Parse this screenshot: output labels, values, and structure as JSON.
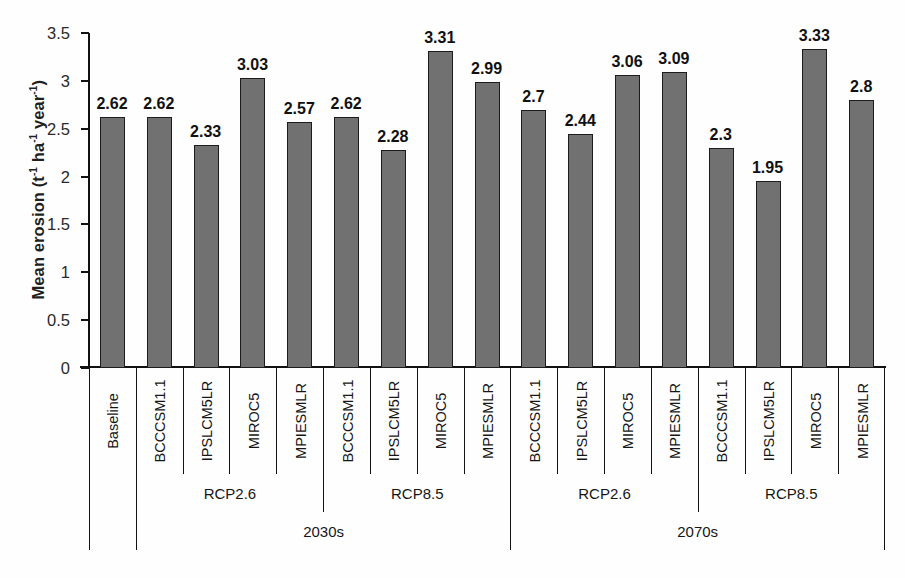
{
  "chart_data": {
    "type": "bar",
    "title": "",
    "xlabel": "",
    "ylabel": "Mean erosion (t-1 ha-1 year-1)",
    "ylabel_parts": {
      "prefix": "Mean erosion (t",
      "sup1": "-1",
      "mid1": " ha",
      "sup2": "-1",
      "mid2": " year",
      "sup3": "-1",
      "suffix": ")"
    },
    "ylim": [
      0,
      3.5
    ],
    "ytick_values": [
      3.5,
      3,
      2.5,
      2,
      1.5,
      1,
      0.5,
      0
    ],
    "ytick_labels": [
      "3.5",
      "3",
      "2.5",
      "2",
      "1.5",
      "1",
      "0.5",
      "0"
    ],
    "grid": false,
    "legend": "none",
    "categories": [
      "Baseline",
      "BCCCSM1.1",
      "IPSLCM5LR",
      "MIROC5",
      "MPIESMLR",
      "BCCCSM1.1",
      "IPSLCM5LR",
      "MIROC5",
      "MPIESMLR",
      "BCCCSM1.1",
      "IPSLCM5LR",
      "MIROC5",
      "MPIESMLR",
      "BCCCSM1.1",
      "IPSLCM5LR",
      "MIROC5",
      "MPIESMLR"
    ],
    "values": [
      2.62,
      2.62,
      2.33,
      3.03,
      2.57,
      2.62,
      2.28,
      3.31,
      2.99,
      2.7,
      2.44,
      3.06,
      3.09,
      2.3,
      1.95,
      3.33,
      2.8
    ],
    "value_labels": [
      "2.62",
      "2.62",
      "2.33",
      "3.03",
      "2.57",
      "2.62",
      "2.28",
      "3.31",
      "2.99",
      "2.7",
      "2.44",
      "3.06",
      "3.09",
      "2.3",
      "1.95",
      "3.33",
      "2.8"
    ],
    "bar_color": "#717171",
    "bar_edge_color": "#1c1c1c",
    "group_level_1": [
      {
        "label": "",
        "start": 0,
        "span": 1
      },
      {
        "label": "RCP2.6",
        "start": 1,
        "span": 4
      },
      {
        "label": "RCP8.5",
        "start": 5,
        "span": 4
      },
      {
        "label": "RCP2.6",
        "start": 9,
        "span": 4
      },
      {
        "label": "RCP8.5",
        "start": 13,
        "span": 4
      }
    ],
    "group_level_2": [
      {
        "label": "",
        "start": 0,
        "span": 1
      },
      {
        "label": "2030s",
        "start": 1,
        "span": 8
      },
      {
        "label": "2070s",
        "start": 9,
        "span": 8
      }
    ]
  }
}
